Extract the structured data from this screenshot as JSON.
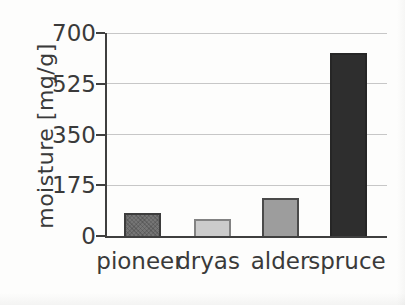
{
  "chart_data": {
    "type": "bar",
    "title": "",
    "xlabel": "",
    "ylabel": "moisture [mg/g]",
    "categories": [
      "pioneer",
      "dryas",
      "alder",
      "spruce"
    ],
    "values": [
      80,
      60,
      130,
      630
    ],
    "ylim": [
      0,
      700
    ],
    "yticks": [
      0,
      175,
      350,
      525,
      700
    ],
    "grid": "horizontal",
    "legend": "none",
    "bars": [
      {
        "label": "pioneer",
        "value": 80,
        "fill": "#757575",
        "border": "#3c3c3c",
        "texture": "crosshatch"
      },
      {
        "label": "dryas",
        "value": 60,
        "fill": "#cbcbcb",
        "border": "#828282",
        "texture": "none"
      },
      {
        "label": "alder",
        "value": 130,
        "fill": "#9d9d9d",
        "border": "#4a4a4a",
        "texture": "none"
      },
      {
        "label": "spruce",
        "value": 630,
        "fill": "#2e2e2e",
        "border": "#262626",
        "texture": "none"
      }
    ],
    "colors": {
      "axis": "#3f3f3f",
      "grid": "#c7c7c7",
      "text": "#3a3a3a",
      "background": "#fdfdfc"
    }
  }
}
